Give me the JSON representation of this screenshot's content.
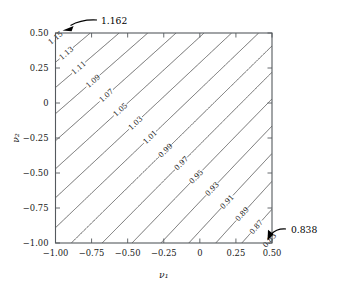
{
  "chart_data": {
    "type": "contour",
    "title": "",
    "xlabel": "ν₁",
    "ylabel": "ν₂",
    "xlim": [
      -1.0,
      0.5
    ],
    "ylim": [
      -1.0,
      0.5
    ],
    "xticks": [
      "−1.00",
      "−0.75",
      "−0.50",
      "−0.25",
      "0",
      "0.25",
      "0.50"
    ],
    "xtick_values": [
      -1.0,
      -0.75,
      -0.5,
      -0.25,
      0,
      0.25,
      0.5
    ],
    "yticks": [
      "0.50",
      "0.25",
      "0",
      "−0.25",
      "−0.50",
      "−0.75",
      "−1.00"
    ],
    "ytick_values": [
      0.5,
      0.25,
      0,
      -0.25,
      -0.5,
      -0.75,
      -1.0
    ],
    "grid": false,
    "legend": "none",
    "contour_interval": 0.02,
    "levels": [
      {
        "value": 0.85,
        "label": "0.85"
      },
      {
        "value": 0.87,
        "label": "0.87"
      },
      {
        "value": 0.89,
        "label": "0.89"
      },
      {
        "value": 0.91,
        "label": "0.91"
      },
      {
        "value": 0.93,
        "label": "0.93"
      },
      {
        "value": 0.95,
        "label": "0.95"
      },
      {
        "value": 0.97,
        "label": "0.97"
      },
      {
        "value": 0.99,
        "label": "0.99"
      },
      {
        "value": 1.01,
        "label": "1.01"
      },
      {
        "value": 1.03,
        "label": "1.03"
      },
      {
        "value": 1.05,
        "label": "1.05"
      },
      {
        "value": 1.07,
        "label": "1.07"
      },
      {
        "value": 1.09,
        "label": "1.09"
      },
      {
        "value": 1.11,
        "label": "1.11"
      },
      {
        "value": 1.13,
        "label": "1.13"
      },
      {
        "value": 1.15,
        "label": "1.15"
      }
    ],
    "annotations": [
      {
        "text": "1.162",
        "role": "maximum",
        "corner": "top-left"
      },
      {
        "text": "0.838",
        "role": "minimum",
        "corner": "bottom-right"
      }
    ],
    "extremes": {
      "max": 1.162,
      "min": 0.838
    },
    "line_color": "#3a3a3a",
    "frame_color": "#555a5e"
  }
}
